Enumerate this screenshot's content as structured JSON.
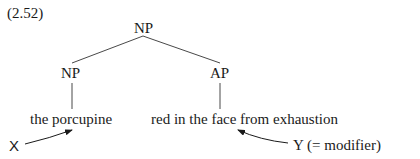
{
  "example_number": "(2.52)",
  "tree": {
    "root": "NP",
    "left": {
      "label": "NP",
      "text": "the porcupine"
    },
    "right": {
      "label": "AP",
      "text": "red in the face from exhaustion"
    }
  },
  "annotations": {
    "x_label": "X",
    "y_label": "Y (= modifier)"
  }
}
